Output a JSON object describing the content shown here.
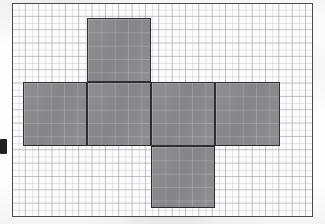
{
  "figure": {
    "shape_kind": "cube-net",
    "face_count": 6,
    "paper": {
      "background_color": "#fcfcfc",
      "grid_color": "#96989e",
      "grid_cell_px": 13.35,
      "border_color": "#4a4a4c",
      "border_width_px": 1.6,
      "sheet": {
        "x": 12,
        "y": 3,
        "width": 301,
        "height": 214
      },
      "columns": 22,
      "rows": 16
    },
    "face_style": {
      "fill_color": "#8a8a8c",
      "stroke_color": "#2e2e30",
      "stroke_width_px": 1.8,
      "size_px": 64,
      "size_cells": 4.8
    },
    "faces": [
      {
        "id": "face-top",
        "label": "top",
        "row": "upper",
        "col": 2,
        "x": 87,
        "y": 18,
        "w": 64,
        "h": 64
      },
      {
        "id": "face-left",
        "label": "left",
        "row": "middle",
        "col": 1,
        "x": 23,
        "y": 82,
        "w": 64,
        "h": 64
      },
      {
        "id": "face-front",
        "label": "front",
        "row": "middle",
        "col": 2,
        "x": 87,
        "y": 82,
        "w": 64,
        "h": 64
      },
      {
        "id": "face-right",
        "label": "right",
        "row": "middle",
        "col": 3,
        "x": 151,
        "y": 82,
        "w": 64,
        "h": 64
      },
      {
        "id": "face-back",
        "label": "back",
        "row": "middle",
        "col": 4,
        "x": 215,
        "y": 82,
        "w": 65,
        "h": 64
      },
      {
        "id": "face-bottom",
        "label": "bottom",
        "row": "lower",
        "col": 3,
        "x": 151,
        "y": 146,
        "w": 64,
        "h": 62
      }
    ],
    "artifacts": [
      {
        "id": "edge-ink-blob",
        "x": 0,
        "y": 139,
        "w": 7,
        "h": 15,
        "color": "#1f1f22"
      }
    ]
  }
}
